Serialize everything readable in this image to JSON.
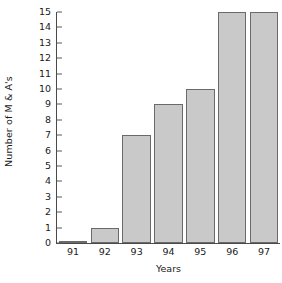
{
  "chart_data": {
    "type": "bar",
    "title": "",
    "subtitle": "",
    "xlabel": "Years",
    "ylabel": "Number of M & A's",
    "categories": [
      "91",
      "92",
      "93",
      "94",
      "95",
      "96",
      "97"
    ],
    "values": [
      0.15,
      1,
      7,
      9,
      10,
      15,
      15
    ],
    "series": [
      {
        "name": "M & A's",
        "values": [
          0.15,
          1,
          7,
          9,
          10,
          15,
          15
        ]
      }
    ],
    "ylim": [
      0,
      15
    ],
    "ytick_labels": [
      "0",
      "1",
      "2",
      "3",
      "4",
      "5",
      "6",
      "7",
      "8",
      "9",
      "10",
      "11",
      "12",
      "13",
      "14",
      "15"
    ],
    "ytick_values": [
      0,
      1,
      2,
      3,
      4,
      5,
      6,
      7,
      8,
      9,
      10,
      11,
      12,
      13,
      14,
      15
    ],
    "grid": false,
    "legend": false,
    "legend_position": "none",
    "bar_fill_color": "#c9c9c9",
    "bar_edge_color": "#6a6a6a",
    "axis_color": "#4a4a4a",
    "text_color": "#1a1a1a",
    "background_color": "#ffffff"
  }
}
